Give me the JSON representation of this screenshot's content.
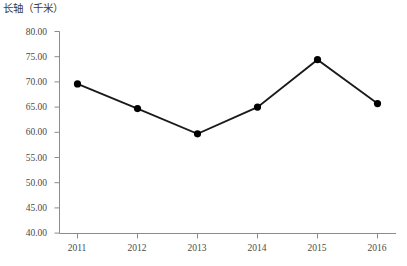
{
  "chart_data": {
    "type": "line",
    "title": "长轴（千米）",
    "xlabel": "",
    "ylabel": "长轴（千米）",
    "categories": [
      "2011",
      "2012",
      "2013",
      "2014",
      "2015",
      "2016"
    ],
    "values": [
      69.6,
      64.7,
      59.7,
      65.0,
      74.4,
      65.7
    ],
    "series": [
      {
        "name": "长轴（千米）",
        "values": [
          69.6,
          64.7,
          59.7,
          65.0,
          74.4,
          65.7
        ]
      }
    ],
    "ylim": [
      40.0,
      80.0
    ],
    "ytick_step": 5.0,
    "ytick_labels": [
      "80.00",
      "75.00",
      "70.00",
      "65.00",
      "60.00",
      "55.00",
      "50.00",
      "45.00",
      "40.00"
    ],
    "ytick_values": [
      80.0,
      75.0,
      70.0,
      65.0,
      60.0,
      55.0,
      50.0,
      45.0,
      40.0
    ],
    "xtick_labels": [
      "2011",
      "2012",
      "2013",
      "2014",
      "2015",
      "2016"
    ],
    "grid": false,
    "legend": false,
    "legend_position": "none",
    "marker": "circle",
    "line_color": "#1a1a1a",
    "marker_color": "#000000",
    "axis_color": "#808080",
    "background_color": "#ffffff"
  }
}
